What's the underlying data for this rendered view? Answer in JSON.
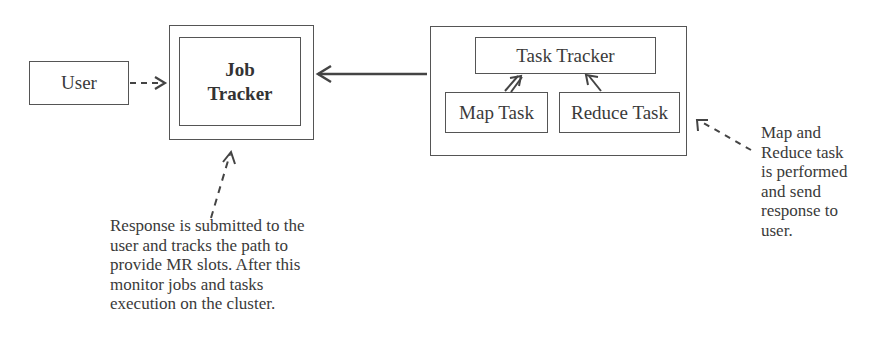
{
  "diagram": {
    "nodes": {
      "user": {
        "label": "User"
      },
      "job_tracker": {
        "label": "Job\nTracker"
      },
      "task_tracker_group": {
        "task_tracker": {
          "label": "Task Tracker"
        },
        "map_task": {
          "label": "Map Task"
        },
        "reduce_task": {
          "label": "Reduce Task"
        }
      }
    },
    "edges": [
      {
        "from": "User",
        "to": "Job Tracker",
        "style": "dashed"
      },
      {
        "from": "Task Tracker group",
        "to": "Job Tracker",
        "style": "solid"
      },
      {
        "from": "Map Task",
        "to": "Task Tracker",
        "style": "solid"
      },
      {
        "from": "Reduce Task",
        "to": "Task Tracker",
        "style": "solid"
      },
      {
        "from": "note-bottom",
        "to": "Job Tracker",
        "style": "dashed"
      },
      {
        "from": "note-right",
        "to": "Task Tracker group",
        "style": "dashed"
      }
    ],
    "notes": {
      "job_tracker_note": "Response is submitted to the\nuser and tracks the path to\nprovide MR slots. After this\nmonitor jobs and tasks\nexecution on the cluster.",
      "task_tracker_note": "Map and\nReduce task\nis performed\nand send\nresponse to\nuser."
    },
    "colors": {
      "line": "#555555",
      "text": "#3a3a3a",
      "background": "#ffffff"
    }
  }
}
